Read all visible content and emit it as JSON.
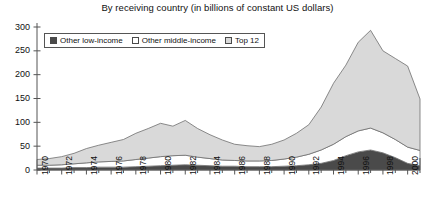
{
  "chart_data": {
    "type": "area",
    "stacked": true,
    "title": "By receiving country (in billions of constant US dollars)",
    "xlabel": "",
    "ylabel": "",
    "ylim": [
      0,
      300
    ],
    "yticks": [
      0,
      50,
      100,
      150,
      200,
      250,
      300
    ],
    "xlim": [
      1970,
      2001
    ],
    "xticks": [
      1970,
      1972,
      1974,
      1976,
      1978,
      1980,
      1982,
      1984,
      1986,
      1988,
      1990,
      1992,
      1994,
      1996,
      1998,
      2000
    ],
    "x": [
      1970,
      1971,
      1972,
      1973,
      1974,
      1975,
      1976,
      1977,
      1978,
      1979,
      1980,
      1981,
      1982,
      1983,
      1984,
      1985,
      1986,
      1987,
      1988,
      1989,
      1990,
      1991,
      1992,
      1993,
      1994,
      1995,
      1996,
      1997,
      1998,
      1999,
      2000,
      2001
    ],
    "grid": false,
    "legend_position": "top-left",
    "series": [
      {
        "name": "Other low-income",
        "color": "#4a4a4a",
        "values": [
          4,
          4,
          4,
          5,
          5,
          6,
          6,
          6,
          7,
          8,
          9,
          10,
          11,
          10,
          9,
          8,
          8,
          7,
          7,
          7,
          8,
          9,
          11,
          14,
          20,
          30,
          38,
          42,
          36,
          26,
          14,
          9
        ]
      },
      {
        "name": "Other middle-income",
        "color": "#ffffff",
        "values": [
          6,
          6,
          7,
          8,
          10,
          11,
          12,
          13,
          15,
          17,
          19,
          20,
          20,
          17,
          15,
          13,
          12,
          12,
          12,
          13,
          15,
          18,
          22,
          28,
          34,
          40,
          44,
          46,
          42,
          38,
          34,
          32
        ]
      },
      {
        "name": "Top 12",
        "color": "#d9d9d9",
        "values": [
          12,
          14,
          17,
          22,
          30,
          35,
          40,
          45,
          55,
          62,
          70,
          62,
          73,
          60,
          50,
          42,
          34,
          32,
          30,
          34,
          40,
          50,
          62,
          90,
          128,
          150,
          186,
          205,
          172,
          170,
          170,
          108
        ]
      }
    ],
    "totals": [
      22,
      24,
      28,
      35,
      45,
      52,
      58,
      64,
      77,
      87,
      98,
      92,
      104,
      87,
      74,
      63,
      54,
      51,
      49,
      54,
      63,
      77,
      95,
      132,
      182,
      220,
      268,
      293,
      250,
      234,
      218,
      149
    ]
  },
  "title": {
    "text": "By receiving country (in billions of constant US dollars)"
  },
  "legend": {
    "items": [
      {
        "label": "Other low-income",
        "swatch": "#4a4a4a"
      },
      {
        "label": "Other middle-income",
        "swatch": "#ffffff"
      },
      {
        "label": "Top 12",
        "swatch": "#d9d9d9"
      }
    ]
  },
  "axes": {
    "y_labels": [
      "300",
      "250",
      "200",
      "150",
      "100",
      "50",
      "0"
    ],
    "x_labels": [
      "1970",
      "1972",
      "1974",
      "1976",
      "1978",
      "1980",
      "1982",
      "1984",
      "1986",
      "1988",
      "1990",
      "1992",
      "1994",
      "1996",
      "1998",
      "2000"
    ]
  }
}
